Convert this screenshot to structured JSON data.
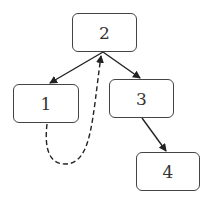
{
  "diagram": {
    "type": "tree",
    "nodes": [
      {
        "id": "2",
        "label": "2",
        "x": 72,
        "y": 13,
        "w": 65,
        "h": 39
      },
      {
        "id": "1",
        "label": "1",
        "x": 13,
        "y": 84,
        "w": 66,
        "h": 39
      },
      {
        "id": "3",
        "label": "3",
        "x": 109,
        "y": 79,
        "w": 65,
        "h": 39
      },
      {
        "id": "4",
        "label": "4",
        "x": 136,
        "y": 152,
        "w": 64,
        "h": 39
      }
    ],
    "edges": [
      {
        "from": "2",
        "to": "1",
        "style": "solid"
      },
      {
        "from": "2",
        "to": "3",
        "style": "solid"
      },
      {
        "from": "3",
        "to": "4",
        "style": "solid"
      },
      {
        "from": "1",
        "to": "2",
        "style": "dashed",
        "curved": true
      }
    ],
    "colors": {
      "stroke": "#333333",
      "background": "#ffffff"
    }
  }
}
